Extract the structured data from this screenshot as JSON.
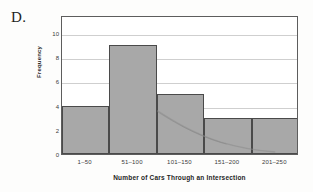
{
  "panel": {
    "letter": "D."
  },
  "chart_data": {
    "type": "bar",
    "title": "",
    "subtitle": "",
    "xlabel": "Number of Cars Through an Intersection",
    "ylabel": "Frequency",
    "categories": [
      "1–50",
      "51–100",
      "101–150",
      "151–200",
      "201–250"
    ],
    "values": [
      4,
      9,
      5,
      3,
      3
    ],
    "ylim": [
      0,
      11.5
    ],
    "yticks": [
      0,
      2,
      4,
      6,
      8,
      10
    ],
    "ytick_labels": [
      "0",
      "2",
      "4",
      "6",
      "8",
      "10"
    ],
    "grid": true,
    "grid_axis": "y",
    "legend": "none",
    "bar_fill": "#a8a8a8",
    "bar_stroke": "#4a4a4a",
    "gridline_color": "#cfcfcf",
    "frame_color": "#5d5d5d",
    "histogram": true,
    "bar_gap": 0
  }
}
